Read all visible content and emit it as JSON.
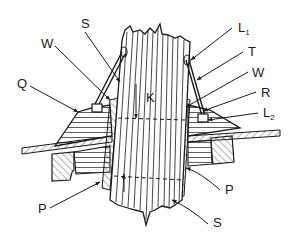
{
  "figure": {
    "type": "technical cross-section drawing",
    "colors": {
      "ink": "#1a1a1a",
      "background": "#ffffff"
    }
  },
  "labels": {
    "S_top": {
      "text": "S",
      "x": 81,
      "y": 28
    },
    "W_left": {
      "text": "W",
      "x": 41,
      "y": 48
    },
    "Q": {
      "text": "Q",
      "x": 17,
      "y": 88
    },
    "K": {
      "text": "K",
      "x": 146,
      "y": 102
    },
    "L1": {
      "text": "L",
      "sub": "1",
      "x": 238,
      "y": 32
    },
    "T": {
      "text": "T",
      "x": 248,
      "y": 56
    },
    "W_right": {
      "text": "W",
      "x": 252,
      "y": 77
    },
    "R": {
      "text": "R",
      "x": 261,
      "y": 97
    },
    "L2": {
      "text": "L",
      "sub": "2",
      "x": 263,
      "y": 117
    },
    "P_left": {
      "text": "P",
      "x": 38,
      "y": 213
    },
    "P_right": {
      "text": "P",
      "x": 225,
      "y": 194
    },
    "S_bottom": {
      "text": "S",
      "x": 213,
      "y": 227
    }
  }
}
